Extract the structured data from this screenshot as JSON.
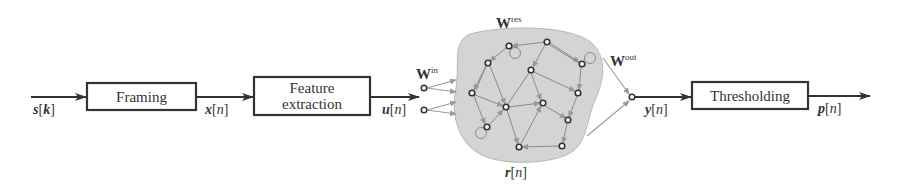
{
  "diagram": {
    "type": "block-diagram",
    "blocks": [
      {
        "id": "framing",
        "label": "Framing"
      },
      {
        "id": "feature",
        "label_line1": "Feature",
        "label_line2": "extraction"
      },
      {
        "id": "threshold",
        "label": "Thresholding"
      }
    ],
    "signals": {
      "input": {
        "base": "s",
        "index": "k",
        "text": "s[k]"
      },
      "frames": {
        "base": "x",
        "index": "n",
        "text": "x[n]"
      },
      "features": {
        "base": "u",
        "index": "n",
        "text": "u[n]"
      },
      "reservoir_state": {
        "base": "r",
        "index": "n",
        "text": "r[n]"
      },
      "readout": {
        "base": "y",
        "index": "n",
        "text": "y[n]"
      },
      "output": {
        "base": "p",
        "index": "n",
        "text": "p[n]"
      }
    },
    "weights": {
      "input": {
        "base": "W",
        "sup": "in"
      },
      "reservoir": {
        "base": "W",
        "sup": "res"
      },
      "output": {
        "base": "W",
        "sup": "out"
      }
    },
    "reservoir": {
      "fill": "#d4d4d4",
      "node_count": 13,
      "input_node_count": 2,
      "self_loop_count": 3
    },
    "colors": {
      "main_line": "#333333",
      "weight_arrow": "#9a9a9a",
      "reservoir_fill": "#d4d4d4"
    }
  }
}
